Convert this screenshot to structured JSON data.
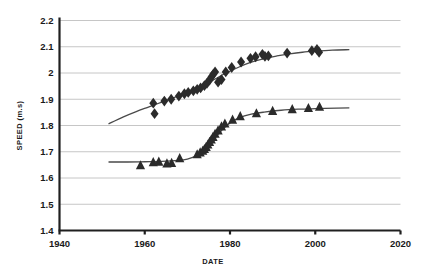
{
  "chart_data": {
    "type": "scatter",
    "title": "",
    "xlabel": "DATE",
    "ylabel": "SPEED (m.s)",
    "xlim": [
      1940,
      2020
    ],
    "ylim": [
      1.4,
      2.2
    ],
    "grid": true,
    "legend": "none",
    "xticks": [
      "1940",
      "1960",
      "1980",
      "2000",
      "2020"
    ],
    "xtick_values": [
      1940,
      1960,
      1980,
      2000,
      2020
    ],
    "yticks": [
      "1.4",
      "1.5",
      "1.6",
      "1.7",
      "1.8",
      "1.9",
      "2",
      "2.1",
      "2.2"
    ],
    "ytick_values": [
      1.4,
      1.5,
      1.6,
      1.7,
      1.8,
      1.9,
      2.0,
      2.1,
      2.2
    ],
    "series": [
      {
        "name": "diamond-series",
        "marker": "diamond",
        "color": "#2b2b2b",
        "points": [
          [
            1962.0,
            1.885
          ],
          [
            1962.3,
            1.845
          ],
          [
            1964.6,
            1.893
          ],
          [
            1966.2,
            1.9
          ],
          [
            1968.0,
            1.912
          ],
          [
            1969.3,
            1.921
          ],
          [
            1970.2,
            1.926
          ],
          [
            1971.4,
            1.932
          ],
          [
            1972.3,
            1.938
          ],
          [
            1973.1,
            1.943
          ],
          [
            1974.0,
            1.952
          ],
          [
            1974.6,
            1.961
          ],
          [
            1975.2,
            1.973
          ],
          [
            1975.6,
            1.984
          ],
          [
            1976.1,
            1.996
          ],
          [
            1976.5,
            2.004
          ],
          [
            1977.2,
            1.965
          ],
          [
            1978.0,
            1.975
          ],
          [
            1979.0,
            2.004
          ],
          [
            1980.4,
            2.021
          ],
          [
            1982.6,
            2.042
          ],
          [
            1984.8,
            2.056
          ],
          [
            1986.0,
            2.062
          ],
          [
            1987.6,
            2.071
          ],
          [
            1988.2,
            2.063
          ],
          [
            1989.0,
            2.065
          ],
          [
            1993.4,
            2.076
          ],
          [
            1999.2,
            2.085
          ],
          [
            2000.4,
            2.09
          ],
          [
            2000.9,
            2.079
          ]
        ],
        "fit_curve": [
          [
            1951.5,
            1.806
          ],
          [
            1955.0,
            1.833
          ],
          [
            1958.0,
            1.853
          ],
          [
            1961.0,
            1.871
          ],
          [
            1964.0,
            1.889
          ],
          [
            1967.0,
            1.907
          ],
          [
            1970.0,
            1.926
          ],
          [
            1973.0,
            1.948
          ],
          [
            1976.0,
            1.973
          ],
          [
            1979.0,
            1.999
          ],
          [
            1982.0,
            2.022
          ],
          [
            1985.0,
            2.041
          ],
          [
            1988.0,
            2.055
          ],
          [
            1991.0,
            2.065
          ],
          [
            1994.0,
            2.073
          ],
          [
            1997.0,
            2.079
          ],
          [
            2000.0,
            2.083
          ],
          [
            2004.0,
            2.087
          ],
          [
            2008.0,
            2.089
          ]
        ]
      },
      {
        "name": "triangle-series",
        "marker": "triangle",
        "color": "#2b2b2b",
        "points": [
          [
            1959.0,
            1.648
          ],
          [
            1962.0,
            1.66
          ],
          [
            1963.3,
            1.662
          ],
          [
            1965.2,
            1.655
          ],
          [
            1966.3,
            1.657
          ],
          [
            1968.2,
            1.675
          ],
          [
            1972.3,
            1.69
          ],
          [
            1973.0,
            1.697
          ],
          [
            1973.6,
            1.703
          ],
          [
            1974.0,
            1.71
          ],
          [
            1974.4,
            1.718
          ],
          [
            1974.8,
            1.727
          ],
          [
            1975.2,
            1.737
          ],
          [
            1975.6,
            1.746
          ],
          [
            1976.0,
            1.756
          ],
          [
            1976.5,
            1.768
          ],
          [
            1977.2,
            1.781
          ],
          [
            1978.0,
            1.796
          ],
          [
            1978.8,
            1.807
          ],
          [
            1980.6,
            1.822
          ],
          [
            1982.4,
            1.835
          ],
          [
            1986.2,
            1.846
          ],
          [
            1990.0,
            1.855
          ],
          [
            1994.6,
            1.862
          ],
          [
            1998.4,
            1.866
          ],
          [
            2001.0,
            1.871
          ]
        ],
        "fit_curve": [
          [
            1951.5,
            1.661
          ],
          [
            1956.0,
            1.661
          ],
          [
            1960.0,
            1.662
          ],
          [
            1964.0,
            1.663
          ],
          [
            1968.0,
            1.667
          ],
          [
            1970.0,
            1.672
          ],
          [
            1972.0,
            1.683
          ],
          [
            1973.5,
            1.698
          ],
          [
            1975.0,
            1.722
          ],
          [
            1976.5,
            1.752
          ],
          [
            1978.0,
            1.781
          ],
          [
            1980.0,
            1.81
          ],
          [
            1982.0,
            1.828
          ],
          [
            1985.0,
            1.843
          ],
          [
            1988.0,
            1.851
          ],
          [
            1992.0,
            1.858
          ],
          [
            1996.0,
            1.862
          ],
          [
            2000.0,
            1.864
          ],
          [
            2005.0,
            1.866
          ],
          [
            2008.0,
            1.867
          ]
        ]
      }
    ]
  }
}
